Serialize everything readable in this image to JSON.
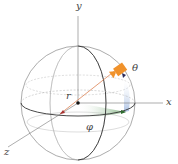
{
  "diagram": {
    "labels": {
      "y_axis": "y",
      "x_axis": "x",
      "z_axis": "z",
      "radius": "r",
      "polar": "θ",
      "azimuth": "φ"
    },
    "colors": {
      "camera": "#f0922b",
      "radius_line": "#d9733f",
      "azimuth_fill": "#5a9a5a",
      "polar_fill": "#9fb8e0",
      "sphere_lines": "#888888",
      "axis": "#777777",
      "arrow": "#3a3a6a"
    }
  }
}
